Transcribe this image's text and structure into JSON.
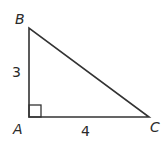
{
  "diagram": {
    "type": "right-triangle",
    "vertices": {
      "A": {
        "label": "A",
        "x": 29,
        "y": 117
      },
      "B": {
        "label": "B",
        "x": 29,
        "y": 28
      },
      "C": {
        "label": "C",
        "x": 149,
        "y": 117
      }
    },
    "sides": {
      "AB": {
        "label": "3"
      },
      "AC": {
        "label": "4"
      }
    },
    "right_angle_at": "A",
    "stroke_color": "#333333",
    "label_color": "#2a2a2a"
  }
}
